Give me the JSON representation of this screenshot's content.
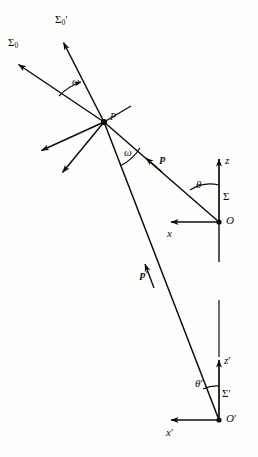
{
  "figure": {
    "kind": "physics-vector-diagram",
    "background_color": "#fdfdfb",
    "ink_color": "#0d0d0d"
  },
  "labels": {
    "sigma_zero": "Σ",
    "sigma_zero_sub": "0",
    "sigma_zero_prime": "Σ",
    "sigma_zero_prime_sub": "0",
    "sigma_zero_prime_mark": "′",
    "point_p": "P",
    "omega_upper": "ω",
    "omega_lower": "ω",
    "vector_p": "p",
    "vector_p_prime": "p",
    "vector_p_prime_mark": "′",
    "axis_z": "z",
    "axis_x": "x",
    "axis_z_prime": "z",
    "axis_z_prime_mark": "′",
    "axis_x_prime": "x",
    "axis_x_prime_mark": "′",
    "theta": "θ",
    "theta_prime": "θ",
    "theta_prime_mark": "′",
    "frame_sigma": "Σ",
    "frame_sigma_prime": "Σ",
    "frame_sigma_prime_mark": "′",
    "origin_o": "O",
    "origin_o_prime": "O",
    "origin_o_prime_mark": "′"
  },
  "geometry": {
    "point_P": {
      "x": 104,
      "y": 122
    },
    "origin_O": {
      "x": 219,
      "y": 222
    },
    "origin_O_prime": {
      "x": 219,
      "y": 420
    },
    "sigma_zero_arrow_tip": {
      "x": 15,
      "y": 62
    },
    "sigma_zero_prime_arrow_tip": {
      "x": 62,
      "y": 39
    },
    "z_axis_tip": {
      "x": 219,
      "y": 156
    },
    "x_axis_tip": {
      "x": 168,
      "y": 222
    },
    "z_prime_axis_tip": {
      "x": 219,
      "y": 357
    },
    "x_prime_axis_tip": {
      "x": 168,
      "y": 420
    },
    "theta_deg": 41,
    "theta_prime_deg": 28,
    "omega_deg": 31
  }
}
